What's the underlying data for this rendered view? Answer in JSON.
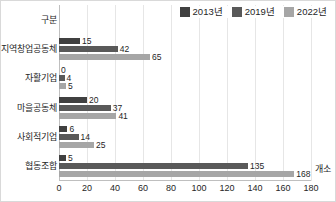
{
  "chart_data": {
    "type": "bar",
    "orientation": "horizontal",
    "title": "",
    "subtitle": "",
    "xlabel": "",
    "ylabel": "",
    "unit_label": "개소",
    "header_label": "구분",
    "categories": [
      "지역창업공동체",
      "자활기업",
      "마을공동체",
      "사회적기업",
      "협동조합"
    ],
    "series": [
      {
        "name": "2013년",
        "color": "#404040",
        "values": [
          15,
          0,
          20,
          6,
          5
        ]
      },
      {
        "name": "2019년",
        "color": "#595959",
        "values": [
          42,
          4,
          37,
          14,
          135
        ]
      },
      {
        "name": "2022년",
        "color": "#a6a6a6",
        "values": [
          65,
          5,
          41,
          25,
          168
        ]
      }
    ],
    "xlim": [
      0,
      180
    ],
    "xticks": [
      0,
      20,
      40,
      60,
      80,
      100,
      120,
      140,
      160,
      180
    ],
    "xtick_labels": [
      "0",
      "20",
      "40",
      "60",
      "80",
      "100",
      "120",
      "140",
      "160",
      "180"
    ],
    "grid": true,
    "grid_axis": "x",
    "legend_position": "top-right",
    "data_labels": true
  },
  "legend": {
    "items": [
      {
        "label": "2013년",
        "color": "#404040"
      },
      {
        "label": "2019년",
        "color": "#595959"
      },
      {
        "label": "2022년",
        "color": "#a6a6a6"
      }
    ]
  },
  "colors": {
    "series_2013": "#404040",
    "series_2019": "#595959",
    "series_2022": "#a6a6a6",
    "gridline": "#e6e6e6",
    "axis": "#bfbfbf",
    "text": "#262626",
    "border": "#d9d9d9",
    "background": "#ffffff"
  }
}
